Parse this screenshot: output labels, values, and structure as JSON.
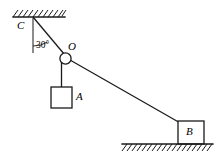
{
  "figure": {
    "type": "free-body-mechanics-diagram",
    "stroke_color": "#1a1a1a",
    "fill_color": "#ffffff",
    "background_color": "#ffffff",
    "labels": {
      "ceiling_anchor": "C",
      "pulley": "O",
      "hanging_block": "A",
      "ground_block": "B",
      "angle": "30°"
    },
    "geometry": {
      "ceiling": {
        "name": "ceiling-support",
        "x1": 13,
        "y1": 17,
        "x2": 65,
        "y2": 17,
        "hatch_direction": "up-right",
        "hatch_side": "above"
      },
      "ground": {
        "name": "ground-support",
        "x1": 122,
        "y1": 144,
        "x2": 213,
        "y2": 144,
        "hatch_direction": "up-right",
        "hatch_side": "below"
      },
      "point_c": {
        "x": 33,
        "y": 17
      },
      "point_o": {
        "x": 66,
        "y": 58
      },
      "pulley_radius": 5.5,
      "vertical_reference": {
        "x1": 33,
        "y1": 18,
        "x2": 33,
        "y2": 53
      },
      "rope_c_to_o": {
        "x1": 33,
        "y1": 17,
        "x2": 64,
        "y2": 54
      },
      "rope_o_to_b": {
        "x1": 70,
        "y1": 60,
        "x2": 178,
        "y2": 122
      },
      "rope_o_to_a": {
        "x1": 61,
        "y1": 63,
        "x2": 61,
        "y2": 87
      },
      "angle_arc": {
        "center_x": 33,
        "center_y": 17,
        "radius": 29,
        "from_deg_from_vertical": 0,
        "to_deg_from_vertical": 30
      },
      "block_a": {
        "x": 51,
        "y": 87,
        "w": 21,
        "h": 21
      },
      "block_b": {
        "x": 178,
        "y": 121,
        "w": 26,
        "h": 23
      }
    },
    "angle_value_degrees": 30
  }
}
